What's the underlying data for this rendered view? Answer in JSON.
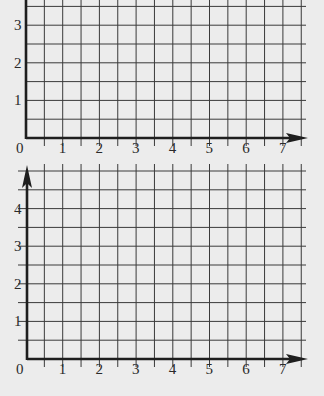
{
  "figure": {
    "background_color": "#ececec",
    "line_color": "#3a3a3a"
  },
  "chart_data": [
    {
      "type": "grid",
      "title": "",
      "xlabel": "",
      "ylabel": "",
      "x_tick_labels": [
        "0",
        "1",
        "2",
        "3",
        "4",
        "5",
        "6",
        "7"
      ],
      "y_tick_labels": [
        "1",
        "2",
        "3"
      ],
      "xlim": [
        0,
        7.5
      ],
      "ylim": [
        0,
        3.5
      ],
      "grid": true,
      "grid_step": 0.5,
      "x_axis_arrow": true,
      "y_axis_arrow": false
    },
    {
      "type": "grid",
      "title": "",
      "xlabel": "",
      "ylabel": "",
      "x_tick_labels": [
        "0",
        "1",
        "2",
        "3",
        "4",
        "5",
        "6",
        "7"
      ],
      "y_tick_labels": [
        "1",
        "2",
        "3",
        "4"
      ],
      "xlim": [
        0,
        7.5
      ],
      "ylim": [
        0,
        5
      ],
      "grid": true,
      "grid_step": 0.5,
      "x_axis_arrow": true,
      "y_axis_arrow": true
    }
  ],
  "top_chart": {
    "origin_label": "0",
    "x_labels": [
      "1",
      "2",
      "3",
      "4",
      "5",
      "6",
      "7"
    ],
    "y_labels": [
      "1",
      "2",
      "3"
    ]
  },
  "bottom_chart": {
    "origin_label": "0",
    "x_labels": [
      "1",
      "2",
      "3",
      "4",
      "5",
      "6",
      "7"
    ],
    "y_labels": [
      "1",
      "2",
      "3",
      "4"
    ]
  }
}
